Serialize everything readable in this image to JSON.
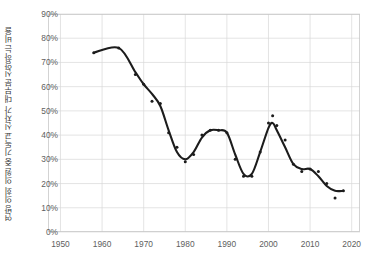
{
  "chart_data": {
    "type": "scatter",
    "title": "",
    "subtitle": "",
    "xlabel": "",
    "ylabel": "연방 의회 의원 중 기독교 신자가 대부분 신앙하는 비율",
    "xlim": [
      1947,
      2022
    ],
    "ylim": [
      0,
      90
    ],
    "xticks": [
      1950,
      1960,
      1970,
      1980,
      1990,
      2000,
      2010,
      2020
    ],
    "xtick_labels": [
      "1950",
      "1960",
      "1970",
      "1980",
      "1990",
      "2000",
      "2010",
      "2020"
    ],
    "yticks": [
      0,
      10,
      20,
      30,
      40,
      50,
      60,
      70,
      80,
      90
    ],
    "ytick_labels": [
      "0%",
      "10%",
      "20%",
      "30%",
      "40%",
      "50%",
      "60%",
      "70%",
      "80%",
      "90%"
    ],
    "grid": true,
    "legend": "none",
    "marker_color": "#1c1c1c",
    "line_color": "#1c1c1c",
    "grid_color": "#d9d9d9",
    "frame_color": "#c9c9c9",
    "background_color": "#ffffff",
    "series": [
      {
        "name": "관측값",
        "marker": "dot",
        "x": [
          1958,
          1964,
          1968,
          1970,
          1972,
          1974,
          1976,
          1978,
          1980,
          1982,
          1984,
          1986,
          1988,
          1990,
          1992,
          1994,
          1996,
          1998,
          2000,
          2001,
          2002,
          2004,
          2006,
          2008,
          2010,
          2012,
          2014,
          2016,
          2018
        ],
        "y": [
          74,
          76,
          65,
          61,
          54,
          53,
          41,
          35,
          29,
          32,
          40,
          42,
          42,
          41,
          30,
          23,
          23,
          33,
          45,
          48,
          44,
          38,
          28,
          25,
          26,
          25,
          20,
          14,
          17
        ]
      },
      {
        "name": "추세선",
        "marker": "none",
        "x": [
          1958,
          1964,
          1968,
          1970,
          1972,
          1974,
          1976,
          1978,
          1980,
          1982,
          1984,
          1986,
          1988,
          1990,
          1992,
          1994,
          1996,
          1998,
          2000,
          2001,
          2002,
          2004,
          2006,
          2008,
          2010,
          2012,
          2014,
          2016,
          2018
        ],
        "y": [
          74,
          76,
          66,
          61,
          57,
          52,
          42,
          33,
          30,
          33,
          39,
          42,
          42,
          41,
          32,
          24,
          24,
          33,
          43,
          45,
          42,
          35,
          28,
          26,
          26,
          23,
          19,
          17,
          17
        ]
      }
    ]
  },
  "axes": {
    "plot_left_px": 48,
    "plot_right_px": 360,
    "plot_top_px": 14,
    "plot_bottom_px": 232
  }
}
